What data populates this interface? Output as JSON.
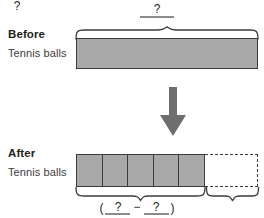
{
  "diagram": {
    "type": "tape-diagram",
    "before": {
      "title": "Before",
      "subtitle": "Tennis balls",
      "bar_label": "?",
      "bar_segments": 1,
      "bar_fill": "#a9a9a9"
    },
    "after": {
      "title": "After",
      "subtitle": "Tennis balls",
      "filled_segments": 5,
      "empty_segments": 1,
      "bar_fill": "#a9a9a9",
      "empty_style": "dashed"
    },
    "transition": {
      "icon": "down-arrow-icon",
      "color": "#6e6e6e"
    },
    "annotations": {
      "top_unknown": "?",
      "bottom_left_expression": {
        "open_paren": "(",
        "first_blank": "?",
        "operator": "−",
        "second_blank": "?",
        "close_paren": ")"
      },
      "bottom_right_unknown": "?"
    },
    "colors": {
      "bar_fill": "#a9a9a9",
      "bar_stroke": "#3b3b3b",
      "arrow": "#6e6e6e",
      "rule": "#8c8c8c",
      "text": "#231f20"
    }
  }
}
